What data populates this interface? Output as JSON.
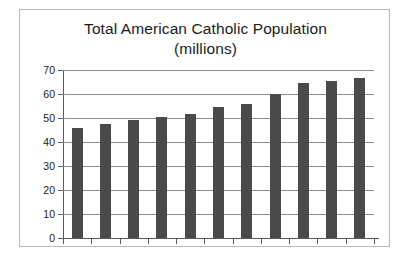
{
  "chart_data": {
    "type": "bar",
    "title": "Total American Catholic Population (millions)",
    "title_line1": "Total American Catholic Population",
    "title_line2": "(millions)",
    "xlabel": "",
    "ylabel": "",
    "ylim": [
      0,
      70
    ],
    "y_ticks": [
      0,
      10,
      20,
      30,
      40,
      50,
      60,
      70
    ],
    "grid": true,
    "legend": false,
    "categories": [
      "",
      "",
      "",
      "",
      "",
      "",
      "",
      "",
      "",
      "",
      ""
    ],
    "values": [
      46,
      47.5,
      49,
      50.5,
      51.5,
      54.5,
      56,
      60,
      64.5,
      65.5,
      66.5
    ],
    "bar_color": "#4a4a4a",
    "axis_color": "#5a5a5a",
    "grid_color": "#8c8c8c",
    "border_color": "#b9b9b9",
    "background_color": "#ffffff",
    "text_color": "#1b1b1b"
  }
}
